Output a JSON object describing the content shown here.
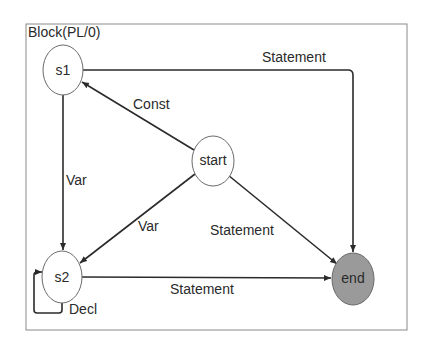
{
  "diagram": {
    "title": "Block(PL/0)",
    "colors": {
      "stroke": "#2b2b2b",
      "frame": "#8a8a8a",
      "node_fill": "#ffffff",
      "end_fill": "#9a9a9a"
    },
    "nodes": [
      {
        "id": "s1",
        "label": "s1"
      },
      {
        "id": "s2",
        "label": "s2"
      },
      {
        "id": "start",
        "label": "start"
      },
      {
        "id": "end",
        "label": "end"
      }
    ],
    "edges": [
      {
        "from": "start",
        "to": "s1",
        "label": "Const"
      },
      {
        "from": "s1",
        "to": "s2",
        "label": "Var"
      },
      {
        "from": "start",
        "to": "s2",
        "label": "Var"
      },
      {
        "from": "s1",
        "to": "end",
        "label": "Statement"
      },
      {
        "from": "start",
        "to": "end",
        "label": "Statement"
      },
      {
        "from": "s2",
        "to": "end",
        "label": "Statement"
      },
      {
        "from": "s2",
        "to": "s2",
        "label": "Decl"
      }
    ]
  }
}
